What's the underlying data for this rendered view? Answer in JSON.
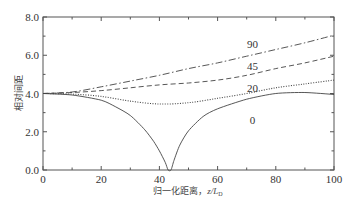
{
  "chart_data": {
    "type": "line",
    "title": "",
    "xlabel": "归一化距离，z/L_D",
    "xlabel_main": "归一化距离，",
    "xlabel_var": "z/L",
    "xlabel_sub": "D",
    "ylabel": "相对间距",
    "xlim": [
      0,
      100
    ],
    "ylim": [
      0,
      8.0
    ],
    "xticks": [
      "0",
      "20",
      "40",
      "60",
      "80",
      "100"
    ],
    "yticks": [
      "0.0",
      "2.0",
      "4.0",
      "6.0",
      "8.0"
    ],
    "grid": false,
    "legend": "inline labels on curves",
    "series": [
      {
        "name": "90",
        "style": "dash-dot",
        "x": [
          0,
          10,
          20,
          30,
          40,
          50,
          60,
          70,
          80,
          90,
          100
        ],
        "values": [
          4.0,
          4.08,
          4.35,
          4.65,
          4.95,
          5.3,
          5.6,
          5.95,
          6.3,
          6.65,
          7.05
        ]
      },
      {
        "name": "45",
        "style": "dashed",
        "x": [
          0,
          10,
          20,
          30,
          40,
          50,
          60,
          70,
          80,
          90,
          100
        ],
        "values": [
          4.0,
          4.05,
          4.15,
          4.3,
          4.45,
          4.55,
          4.7,
          4.95,
          5.3,
          5.6,
          5.95
        ]
      },
      {
        "name": "20",
        "style": "dotted",
        "x": [
          0,
          10,
          20,
          30,
          40,
          50,
          60,
          70,
          80,
          90,
          100
        ],
        "values": [
          4.0,
          3.97,
          3.85,
          3.6,
          3.45,
          3.52,
          3.75,
          4.0,
          4.3,
          4.5,
          4.7
        ]
      },
      {
        "name": "0",
        "style": "solid",
        "x": [
          0,
          10,
          20,
          25,
          30,
          35,
          38,
          40,
          42,
          43,
          44,
          45,
          47,
          50,
          55,
          60,
          70,
          80,
          90,
          100
        ],
        "values": [
          4.0,
          3.92,
          3.65,
          3.3,
          2.85,
          2.1,
          1.5,
          1.0,
          0.4,
          0.0,
          0.0,
          0.5,
          1.3,
          2.05,
          2.8,
          3.2,
          3.7,
          4.0,
          4.05,
          3.95
        ]
      }
    ],
    "curve_labels": [
      {
        "text": "90",
        "x": 72,
        "y": 6.6
      },
      {
        "text": "45",
        "x": 72,
        "y": 5.45
      },
      {
        "text": "20",
        "x": 72,
        "y": 4.3
      },
      {
        "text": "0",
        "x": 72,
        "y": 2.6
      }
    ]
  }
}
